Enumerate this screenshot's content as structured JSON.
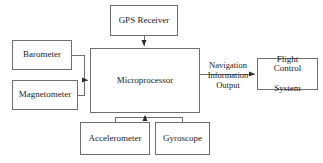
{
  "diagram": {
    "type": "block-diagram",
    "nodes": [
      {
        "id": "gps",
        "label": "GPS Receiver"
      },
      {
        "id": "barometer",
        "label": "Barometer"
      },
      {
        "id": "magneto",
        "label": "Magnetometer"
      },
      {
        "id": "micro",
        "label": "Microprocessor"
      },
      {
        "id": "flight",
        "label": "Flight Control\nSystem"
      },
      {
        "id": "accel",
        "label": "Accelerometer"
      },
      {
        "id": "gyro",
        "label": "Gyroscope"
      }
    ],
    "node_labels": {
      "gps": "GPS Receiver",
      "barometer": "Barometer",
      "magnetometer": "Magnetometer",
      "microprocessor": "Microprocessor",
      "flight_control_line1": "Flight Control",
      "flight_control_line2": "System",
      "accelerometer": "Accelerometer",
      "gyroscope": "Gyroscope"
    },
    "edges": [
      {
        "from": "gps",
        "to": "micro",
        "label": ""
      },
      {
        "from": "barometer",
        "to": "micro",
        "label": ""
      },
      {
        "from": "magneto",
        "to": "micro",
        "label": ""
      },
      {
        "from": "accel",
        "to": "micro",
        "label": ""
      },
      {
        "from": "gyro",
        "to": "micro",
        "label": ""
      },
      {
        "from": "micro",
        "to": "flight",
        "label": "Navigation Information Output"
      }
    ],
    "edge_labels": {
      "output_line1": "Navigation",
      "output_line2": "Information",
      "output_line3": "Output"
    },
    "colors": {
      "background": "#ffffff",
      "box_border": "#6e6e6e",
      "connector": "#6e6e6e",
      "text": "#1a1a1a"
    }
  }
}
